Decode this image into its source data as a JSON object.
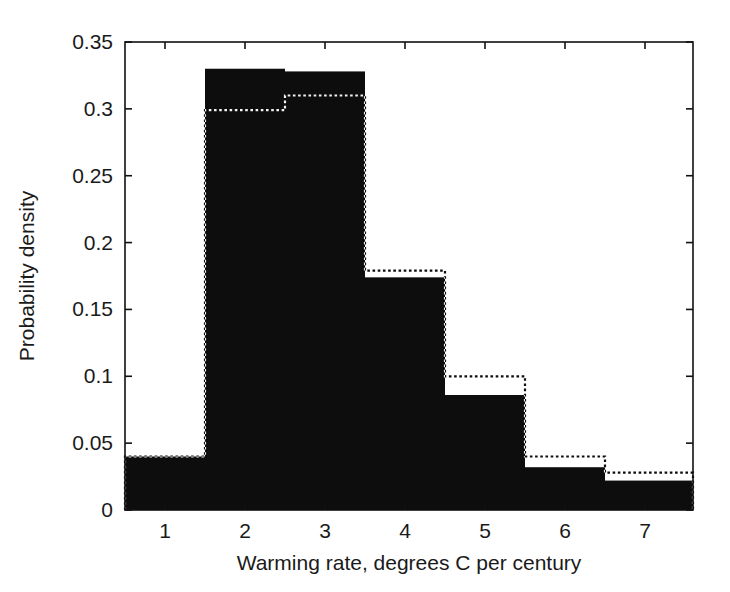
{
  "figure": {
    "background_color": "#ffffff",
    "plot_area": {
      "left": 125,
      "top": 42,
      "right": 693,
      "bottom": 510
    }
  },
  "chart_data": {
    "type": "bar",
    "subtype": "histogram-overlay",
    "title": "",
    "subtitle": "",
    "xlabel": "Warming rate, degrees C per century",
    "ylabel": "Probability density",
    "categories": [
      "1",
      "2",
      "3",
      "4",
      "5",
      "6",
      "7"
    ],
    "x": [
      1,
      2,
      3,
      4,
      5,
      6,
      7
    ],
    "bin_edges": [
      0.5,
      1.5,
      2.5,
      3.5,
      4.5,
      5.5,
      6.5,
      7.6
    ],
    "series": [
      {
        "name": "solid-filled-histogram",
        "style": "filled",
        "color": "#0d0d0d",
        "values": [
          0.04,
          0.33,
          0.328,
          0.174,
          0.086,
          0.032,
          0.022
        ]
      },
      {
        "name": "dotted-outline-histogram",
        "style": "dotted-outline",
        "color": "#f2f2f2",
        "values": [
          0.04,
          0.299,
          0.31,
          0.179,
          0.1,
          0.04,
          0.028
        ]
      }
    ],
    "xlim": [
      0.5,
      7.6
    ],
    "ylim": [
      0,
      0.35
    ],
    "xticks": [
      1,
      2,
      3,
      4,
      5,
      6,
      7
    ],
    "xticklabels": [
      "1",
      "2",
      "3",
      "4",
      "5",
      "6",
      "7"
    ],
    "yticks": [
      0,
      0.05,
      0.1,
      0.15,
      0.2,
      0.25,
      0.3,
      0.35
    ],
    "yticklabels": [
      "0",
      "0.05",
      "0.1",
      "0.15",
      "0.2",
      "0.25",
      "0.3",
      "0.35"
    ],
    "grid": false,
    "legend": "none",
    "box_frame": true,
    "tick_direction": "in"
  }
}
